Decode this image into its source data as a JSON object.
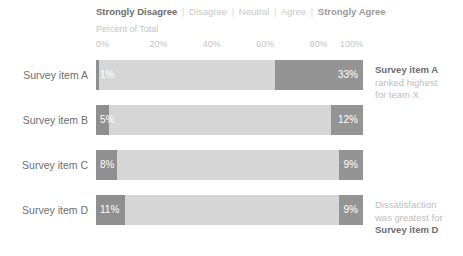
{
  "legend": {
    "items": [
      {
        "label": "Strongly Disagree",
        "style": "emphasis-dark"
      },
      {
        "label": "Disagree",
        "style": "muted"
      },
      {
        "label": "Neutral",
        "style": "muted"
      },
      {
        "label": "Agree",
        "style": "muted"
      },
      {
        "label": "Strongly Agree",
        "style": "emphasis-mid"
      }
    ],
    "separator": "|"
  },
  "axis": {
    "title": "Percent of Total",
    "ticks": [
      "0%",
      "20%",
      "40%",
      "60%",
      "80%",
      "100%"
    ]
  },
  "rows": [
    {
      "label": "Survey item A",
      "left_label": "1%",
      "right_label": "33%",
      "left_pct": 1,
      "right_pct": 33
    },
    {
      "label": "Survey item B",
      "left_label": "5%",
      "right_label": "12%",
      "left_pct": 5,
      "right_pct": 12
    },
    {
      "label": "Survey item C",
      "left_label": "8%",
      "right_label": "9%",
      "left_pct": 8,
      "right_pct": 9
    },
    {
      "label": "Survey item D",
      "left_label": "11%",
      "right_label": "9%",
      "left_pct": 11,
      "right_pct": 9
    }
  ],
  "annotations": {
    "item_a": {
      "strong": "Survey item A",
      "line2": "ranked highest",
      "line3": "for team X"
    },
    "item_d": {
      "line1": "Dissatisfaction",
      "line2": "was greatest for",
      "strong": "Survey item D"
    }
  },
  "colors": {
    "strongly_disagree": "#8f8f8f",
    "middle": "#d6d6d6",
    "strongly_agree": "#949494",
    "label_text": "#6e6e6e",
    "muted_text": "#c4c4c4",
    "bar_value_text": "#ffffff"
  },
  "chart_data": {
    "type": "bar",
    "title": "",
    "subtype": "stacked-horizontal-diverging-likert",
    "xlabel": "Percent of Total",
    "ylabel": "",
    "xlim": [
      0,
      100
    ],
    "xticks": [
      0,
      20,
      40,
      60,
      80,
      100
    ],
    "grid": false,
    "legend_position": "top",
    "categories": [
      "Survey item A",
      "Survey item B",
      "Survey item C",
      "Survey item D"
    ],
    "series": [
      {
        "name": "Strongly Disagree",
        "values": [
          1,
          5,
          8,
          11
        ]
      },
      {
        "name": "Middle (Disagree/Neutral/Agree)",
        "values": [
          66,
          83,
          83,
          80
        ]
      },
      {
        "name": "Strongly Agree",
        "values": [
          33,
          12,
          9,
          9
        ]
      }
    ],
    "data_labels": {
      "Strongly Disagree": [
        "1%",
        "5%",
        "8%",
        "11%"
      ],
      "Strongly Agree": [
        "33%",
        "12%",
        "9%",
        "9%"
      ]
    },
    "annotations": [
      "Survey item A ranked highest for team X",
      "Dissatisfaction was greatest for Survey item D"
    ]
  }
}
